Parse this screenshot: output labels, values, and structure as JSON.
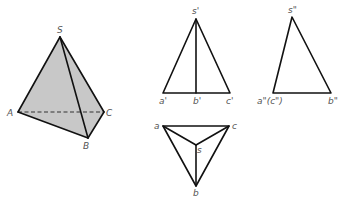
{
  "diagram": {
    "type": "tetrahedron-orthographic-projection",
    "fill_color": "#c8c8c8",
    "line_color": "#111111",
    "label_color": "#555555",
    "perspective": {
      "labels": {
        "S": "S",
        "A": "A",
        "B": "B",
        "C": "C"
      },
      "points": {
        "S": [
          60,
          37
        ],
        "A": [
          18,
          112
        ],
        "B": [
          88,
          138
        ],
        "C": [
          104,
          112
        ]
      },
      "hidden_edge": [
        "A",
        "C"
      ]
    },
    "front_view": {
      "labels": {
        "s": "s'",
        "a": "a'",
        "b": "b'",
        "c": "c'"
      },
      "points": {
        "s": [
          196,
          19
        ],
        "a": [
          163,
          93
        ],
        "b": [
          196,
          93
        ],
        "c": [
          230,
          93
        ]
      }
    },
    "side_view": {
      "labels": {
        "s": "s\"",
        "ac": "a\"(c\")",
        "b": "b\""
      },
      "points": {
        "s": [
          292,
          17
        ],
        "ac": [
          273,
          93
        ],
        "b": [
          331,
          93
        ]
      }
    },
    "top_view": {
      "labels": {
        "a": "a",
        "b": "b",
        "c": "c",
        "s": "s"
      },
      "points": {
        "a": [
          163,
          126
        ],
        "c": [
          229,
          126
        ],
        "s": [
          196,
          145
        ],
        "b": [
          196,
          186
        ]
      }
    }
  }
}
